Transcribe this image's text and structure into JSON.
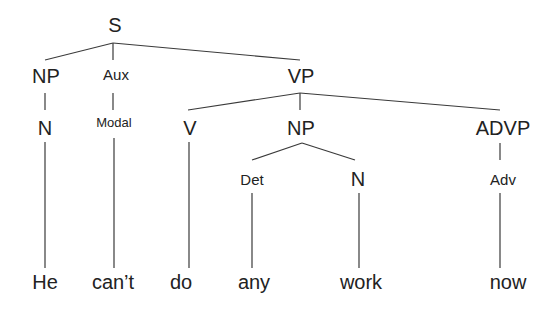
{
  "diagram": {
    "type": "syntax-tree",
    "sentence": "He can't do any work now",
    "nodes": {
      "s": "S",
      "np_subj": "NP",
      "aux": "Aux",
      "vp": "VP",
      "n_subj": "N",
      "modal": "Modal",
      "v": "V",
      "np_obj": "NP",
      "advp": "ADVP",
      "det": "Det",
      "n_obj": "N",
      "adv": "Adv"
    },
    "words": {
      "he": "He",
      "cant": "can’t",
      "do": "do",
      "any": "any",
      "work": "work",
      "now": "now"
    },
    "edges": [
      [
        "S",
        "NP"
      ],
      [
        "S",
        "Aux"
      ],
      [
        "S",
        "VP"
      ],
      [
        "NP",
        "N"
      ],
      [
        "Aux",
        "Modal"
      ],
      [
        "VP",
        "V"
      ],
      [
        "VP",
        "NP"
      ],
      [
        "VP",
        "ADVP"
      ],
      [
        "NP",
        "Det"
      ],
      [
        "NP",
        "N"
      ],
      [
        "ADVP",
        "Adv"
      ],
      [
        "N",
        "He"
      ],
      [
        "Modal",
        "can’t"
      ],
      [
        "V",
        "do"
      ],
      [
        "Det",
        "any"
      ],
      [
        "N",
        "work"
      ],
      [
        "Adv",
        "now"
      ]
    ]
  }
}
